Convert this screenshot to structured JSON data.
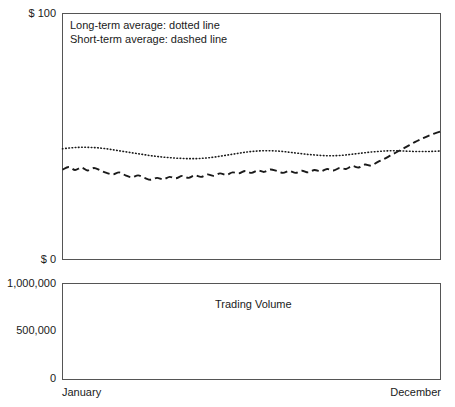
{
  "chart_data": {
    "type": "line",
    "title": "",
    "panels": [
      {
        "name": "price-panel",
        "ylabel": "",
        "ylim": [
          0,
          100
        ],
        "y_ticks": [
          {
            "value": 100,
            "label": "$ 100"
          },
          {
            "value": 0,
            "label": "$ 0"
          }
        ],
        "grid": false,
        "legend_position": "top-left-inside",
        "legend": [
          "Long-term average: dotted line",
          "Short-term average: dashed line"
        ],
        "x": [
          0,
          1,
          2,
          3,
          4,
          5,
          6,
          7,
          8,
          9,
          10,
          11,
          12,
          13,
          14,
          15,
          16,
          17,
          18,
          19,
          20,
          21,
          22,
          23,
          24,
          25,
          26,
          27,
          28,
          29,
          30,
          31,
          32,
          33,
          34,
          35,
          36,
          37,
          38,
          39,
          40,
          41,
          42,
          43,
          44,
          45,
          46,
          47,
          48,
          49,
          50,
          51,
          52,
          53,
          54,
          55,
          56,
          57,
          58,
          59,
          60
        ],
        "series": [
          {
            "name": "Long-term average",
            "style": "dotted",
            "values": [
              45.0,
              45.3,
              45.5,
              45.6,
              45.6,
              45.5,
              45.3,
              45.0,
              44.6,
              44.2,
              43.8,
              43.4,
              43.0,
              42.6,
              42.2,
              41.9,
              41.6,
              41.4,
              41.2,
              41.1,
              41.0,
              41.0,
              41.1,
              41.3,
              41.6,
              42.0,
              42.4,
              42.8,
              43.2,
              43.6,
              43.9,
              44.1,
              44.2,
              44.2,
              44.1,
              43.9,
              43.6,
              43.3,
              43.0,
              42.7,
              42.5,
              42.3,
              42.2,
              42.2,
              42.3,
              42.5,
              42.8,
              43.1,
              43.4,
              43.7,
              43.9,
              44.1,
              44.2,
              44.2,
              44.1,
              44.0,
              43.9,
              43.9,
              43.9,
              44.0,
              44.1
            ]
          },
          {
            "name": "Short-term average",
            "style": "dashed",
            "values": [
              36.5,
              37.6,
              36.4,
              37.4,
              36.2,
              37.2,
              36.2,
              35.2,
              34.6,
              35.4,
              34.2,
              33.4,
              34.2,
              33.2,
              32.4,
              33.2,
              32.6,
              33.6,
              33.0,
              34.0,
              33.2,
              34.2,
              33.6,
              34.6,
              34.0,
              35.0,
              34.4,
              35.4,
              35.0,
              36.0,
              35.2,
              36.2,
              35.6,
              36.6,
              36.0,
              35.2,
              36.0,
              35.2,
              36.1,
              35.4,
              36.4,
              35.8,
              36.8,
              36.2,
              37.2,
              36.8,
              38.0,
              37.4,
              38.6,
              38.2,
              39.6,
              40.8,
              42.2,
              43.6,
              45.0,
              46.4,
              47.8,
              49.0,
              50.2,
              51.2,
              52.0
            ]
          }
        ]
      },
      {
        "name": "volume-panel",
        "title": "Trading Volume",
        "ylabel": "",
        "ylim": [
          0,
          1000000
        ],
        "y_ticks": [
          {
            "value": 1000000,
            "label": "1,000,000"
          },
          {
            "value": 500000,
            "label": "500,000"
          },
          {
            "value": 0,
            "label": "0"
          }
        ],
        "grid": false,
        "x": [
          0,
          1,
          2,
          3,
          4,
          5,
          6,
          7,
          8,
          9,
          10,
          11,
          12,
          13,
          14,
          15,
          16,
          17,
          18,
          19,
          20,
          21,
          22,
          23,
          24,
          25,
          26,
          27,
          28,
          29,
          30,
          31,
          32,
          33,
          34,
          35,
          36,
          37,
          38,
          39,
          40,
          41,
          42,
          43,
          44,
          45,
          46,
          47,
          48,
          49,
          50,
          51,
          52,
          53,
          54,
          55,
          56,
          57,
          58,
          59,
          60
        ],
        "series": [
          {
            "name": "Trading Volume",
            "style": "solid",
            "values": [
              245000,
              247000,
              252000,
              262000,
              272000,
              268000,
              258000,
              252000,
              262000,
              275000,
              268000,
              256000,
              252000,
              262000,
              272000,
              262000,
              250000,
              244000,
              240000,
              248000,
              258000,
              252000,
              246000,
              250000,
              258000,
              252000,
              248000,
              256000,
              268000,
              278000,
              272000,
              262000,
              255000,
              250000,
              260000,
              272000,
              282000,
              275000,
              265000,
              262000,
              272000,
              282000,
              292000,
              286000,
              278000,
              286000,
              300000,
              312000,
              305000,
              295000,
              300000,
              315000,
              330000,
              322000,
              312000,
              320000,
              338000,
              330000,
              325000,
              340000,
              358000,
              352000,
              348000,
              362000,
              385000,
              405000,
              425000,
              450000,
              480000,
              515000,
              545000
            ]
          }
        ],
        "x_ticks": [
          {
            "position": "start",
            "label": "January"
          },
          {
            "position": "end",
            "label": "December"
          }
        ]
      }
    ]
  },
  "labels": {
    "price_top": "$ 100",
    "price_bottom": "$ 0",
    "volume_top": "1,000,000",
    "volume_mid": "500,000",
    "volume_zero": "0",
    "month_start": "January",
    "month_end": "December",
    "volume_panel_title": "Trading Volume",
    "legend_long": "Long-term average: dotted line",
    "legend_short": "Short-term average: dashed line"
  },
  "colors": {
    "ink": "#1a1a1a",
    "axis": "#555555",
    "background": "#ffffff"
  }
}
